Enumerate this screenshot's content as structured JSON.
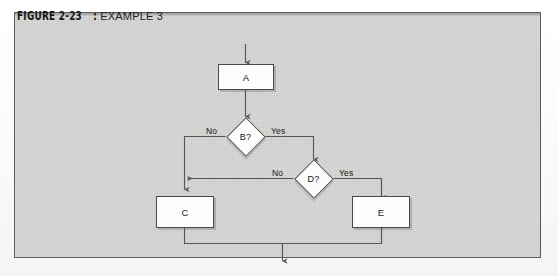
{
  "figure": {
    "label": "FIGURE 2-23",
    "colon": ":",
    "caption": "EXAMPLE 3"
  },
  "colors": {
    "panel_background": "#d6d6d4",
    "frame_border": "#5d5d5d",
    "node_fill": "#fcfcfa",
    "node_border": "#4a4a4a",
    "connector": "#55555a",
    "text": "#19191b"
  },
  "flowchart": {
    "type": "flowchart",
    "nodes": [
      {
        "id": "A",
        "shape": "process",
        "label": "A"
      },
      {
        "id": "B",
        "shape": "decision",
        "label": "B?"
      },
      {
        "id": "D",
        "shape": "decision",
        "label": "D?"
      },
      {
        "id": "C",
        "shape": "process",
        "label": "C"
      },
      {
        "id": "E",
        "shape": "process",
        "label": "E"
      }
    ],
    "edge_labels": {
      "b_no": "No",
      "b_yes": "Yes",
      "d_no": "No",
      "d_yes": "Yes"
    },
    "edges": [
      {
        "from": "start",
        "to": "A",
        "label": ""
      },
      {
        "from": "A",
        "to": "B",
        "label": ""
      },
      {
        "from": "B",
        "to": "C",
        "label": "No"
      },
      {
        "from": "B",
        "to": "D",
        "label": "Yes"
      },
      {
        "from": "D",
        "to": "C",
        "label": "No"
      },
      {
        "from": "D",
        "to": "E",
        "label": "Yes"
      },
      {
        "from": "C",
        "to": "end",
        "label": ""
      },
      {
        "from": "E",
        "to": "end",
        "label": ""
      }
    ]
  }
}
